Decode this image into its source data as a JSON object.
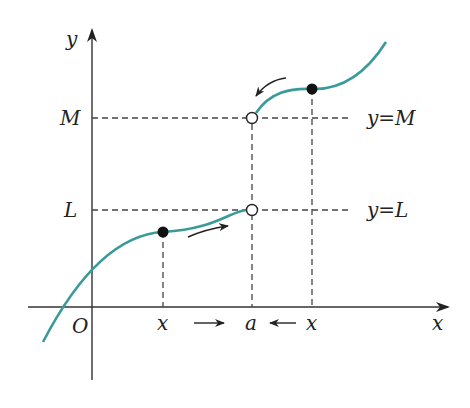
{
  "diagram": {
    "colors": {
      "curve": "#3a9a9a",
      "axis": "#333333",
      "dash": "#444444",
      "dot": "#111111"
    },
    "labels": {
      "y_axis": "y",
      "x_axis": "x",
      "origin": "O",
      "M": "M",
      "L": "L",
      "line_M": "y=M",
      "line_L": "y=L",
      "a": "a",
      "x_left": "x",
      "x_right": "x"
    },
    "arrows": {
      "x_left_to_a": "→",
      "x_right_to_a": "←"
    }
  }
}
